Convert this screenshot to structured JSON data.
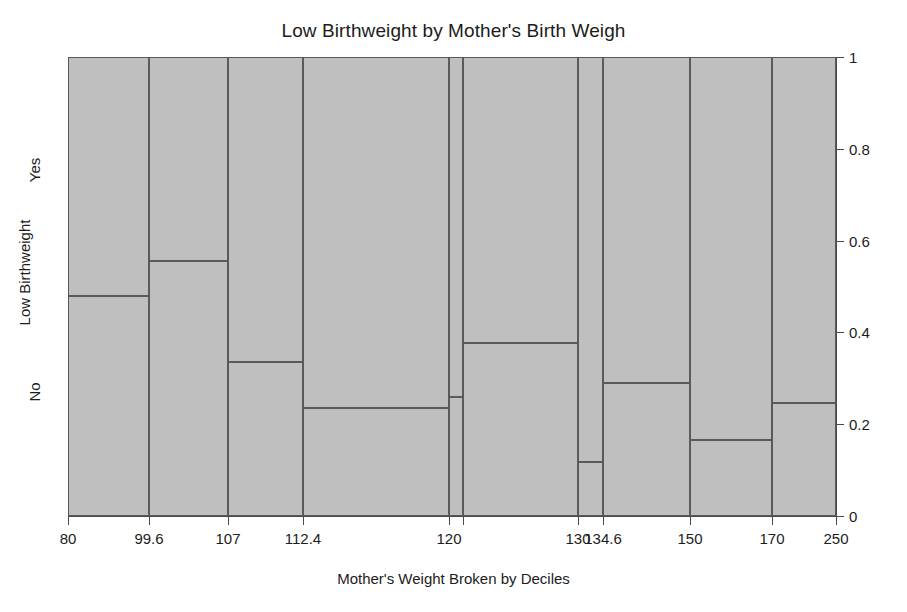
{
  "title": "Low Birthweight by Mother's Birth Weigh",
  "xlabel": "Mother's Weight Broken by Deciles",
  "ylabel": "Low Birthweight",
  "ycategories": [
    {
      "label": "Yes",
      "top": 170
    },
    {
      "label": "No",
      "top": 392
    }
  ],
  "axis": {
    "yticks": [
      {
        "label": "1",
        "value": 1.0
      },
      {
        "label": "0.8",
        "value": 0.8
      },
      {
        "label": "0.6",
        "value": 0.6
      },
      {
        "label": "0.4",
        "value": 0.4
      },
      {
        "label": "0.2",
        "value": 0.2
      },
      {
        "label": "0",
        "value": 0.0
      }
    ],
    "xticks": [
      {
        "label": "80",
        "x": 68
      },
      {
        "label": "99.6",
        "x": 149
      },
      {
        "label": "107",
        "x": 228
      },
      {
        "label": "112.4",
        "x": 303
      },
      {
        "label": "120",
        "x": 449
      },
      {
        "label": "",
        "x": 463
      },
      {
        "label": "130",
        "x": 578
      },
      {
        "label": "134.6",
        "x": 603
      },
      {
        "label": "150",
        "x": 690
      },
      {
        "label": "170",
        "x": 772
      },
      {
        "label": "250",
        "x": 836
      }
    ]
  },
  "colors": {
    "tile_fill": "#bfbfbf",
    "tile_border": "#5a5a5a",
    "axis": "#4a4a4a",
    "text": "#1c1c1c",
    "background": "#ffffff"
  },
  "chart_data": {
    "type": "mosaic",
    "title": "Low Birthweight by Mother's Birth Weigh",
    "xlabel": "Mother's Weight Broken by Deciles",
    "ylabel": "Low Birthweight",
    "ylim": [
      0,
      1
    ],
    "grid": false,
    "legend": "none",
    "row_categories": [
      "Yes",
      "No"
    ],
    "x_breaks": [
      80,
      99.6,
      107,
      112.4,
      120,
      130,
      134.6,
      150,
      170,
      250
    ],
    "x_tick_labels": [
      "80",
      "99.6",
      "107",
      "112.4",
      "120",
      "130",
      "134.6",
      "150",
      "170",
      "250"
    ],
    "y_tick_labels": [
      "0",
      "0.2",
      "0.4",
      "0.6",
      "0.8",
      "1"
    ],
    "tiles": [
      {
        "bin": "80-99.6",
        "x_left_px": 68,
        "x_right_px": 149,
        "width_frac": 0.105,
        "yes_frac": 0.521,
        "no_frac": 0.479
      },
      {
        "bin": "99.6-107",
        "x_left_px": 149,
        "x_right_px": 228,
        "width_frac": 0.103,
        "yes_frac": 0.444,
        "no_frac": 0.556
      },
      {
        "bin": "107-112.4",
        "x_left_px": 228,
        "x_right_px": 303,
        "width_frac": 0.098,
        "yes_frac": 0.665,
        "no_frac": 0.335
      },
      {
        "bin": "112.4-120",
        "x_left_px": 303,
        "x_right_px": 449,
        "width_frac": 0.19,
        "yes_frac": 0.765,
        "no_frac": 0.235
      },
      {
        "bin": "120-120",
        "x_left_px": 449,
        "x_right_px": 463,
        "width_frac": 0.018,
        "yes_frac": 0.741,
        "no_frac": 0.259
      },
      {
        "bin": "120-130",
        "x_left_px": 463,
        "x_right_px": 578,
        "width_frac": 0.15,
        "yes_frac": 0.624,
        "no_frac": 0.376
      },
      {
        "bin": "130-134.6",
        "x_left_px": 578,
        "x_right_px": 603,
        "width_frac": 0.033,
        "yes_frac": 0.882,
        "no_frac": 0.118
      },
      {
        "bin": "134.6-150",
        "x_left_px": 603,
        "x_right_px": 690,
        "width_frac": 0.113,
        "yes_frac": 0.71,
        "no_frac": 0.29
      },
      {
        "bin": "150-170",
        "x_left_px": 690,
        "x_right_px": 772,
        "width_frac": 0.107,
        "yes_frac": 0.834,
        "no_frac": 0.166
      },
      {
        "bin": "170-250",
        "x_left_px": 772,
        "x_right_px": 836,
        "width_frac": 0.083,
        "yes_frac": 0.754,
        "no_frac": 0.246
      }
    ]
  }
}
